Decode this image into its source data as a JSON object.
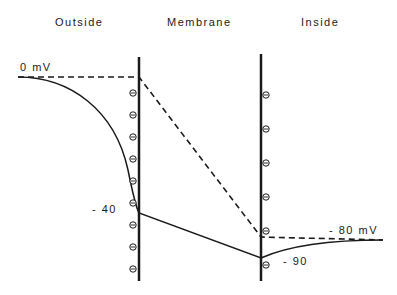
{
  "regions": {
    "outside": "Outside",
    "membrane": "Membrane",
    "inside": "Inside"
  },
  "labels": {
    "zero": "0  mV",
    "minus40": "-  40",
    "minus80": "-  80  mV",
    "minus90": "-  90"
  },
  "potentials_mv": {
    "outside_bulk": 0,
    "outer_membrane_surface": -40,
    "inner_membrane_surface": -90,
    "inside_bulk": -80
  },
  "charges": {
    "outer_membrane_symbol": "negative",
    "outer_membrane_count": 9,
    "inner_membrane_symbol": "negative",
    "inner_membrane_count": 6
  },
  "colors": {
    "ink": "#1a1a1a",
    "background": "#ffffff"
  }
}
